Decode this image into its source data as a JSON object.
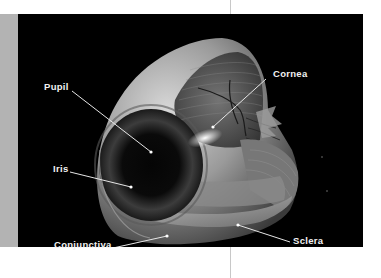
{
  "figure": {
    "background_color": "#000000",
    "label_color": "#f2f2f2",
    "labels": [
      {
        "id": "pupil",
        "text": "Pupil",
        "x": 44,
        "y": 82,
        "target": [
          151,
          152
        ]
      },
      {
        "id": "cornea",
        "text": "Cornea",
        "x": 273,
        "y": 69,
        "target": [
          213,
          127
        ]
      },
      {
        "id": "iris",
        "text": "Iris",
        "x": 53,
        "y": 164,
        "target": [
          131,
          187
        ]
      },
      {
        "id": "conjunctiva",
        "text": "Conjunctiva",
        "x": 54,
        "y": 240,
        "target": [
          167,
          236
        ]
      },
      {
        "id": "sclera",
        "text": "Sclera",
        "x": 293,
        "y": 236,
        "target": [
          238,
          225
        ]
      }
    ]
  }
}
